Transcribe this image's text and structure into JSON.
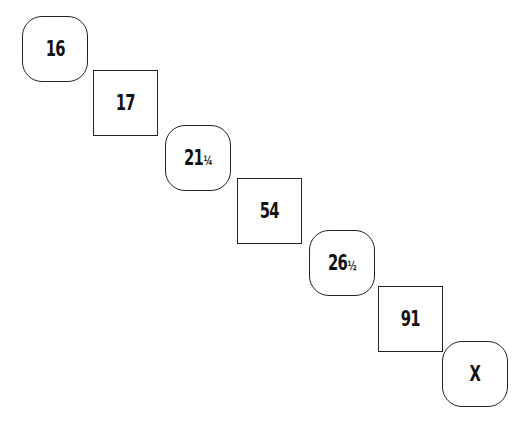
{
  "puzzle": {
    "description": "Number sequence puzzle with alternating rounded and square boxes arranged diagonally; find the missing value X",
    "items": [
      {
        "shape": "rounded",
        "whole": "16",
        "fraction": "",
        "x": 22,
        "y": 16
      },
      {
        "shape": "square",
        "whole": "17",
        "fraction": "",
        "x": 93,
        "y": 70
      },
      {
        "shape": "rounded",
        "whole": "21",
        "fraction": "¼",
        "x": 165,
        "y": 125
      },
      {
        "shape": "square",
        "whole": "54",
        "fraction": "",
        "x": 237,
        "y": 178
      },
      {
        "shape": "rounded",
        "whole": "26",
        "fraction": "½",
        "x": 309,
        "y": 230
      },
      {
        "shape": "square",
        "whole": "91",
        "fraction": "",
        "x": 378,
        "y": 286
      },
      {
        "shape": "rounded",
        "whole": "X",
        "fraction": "",
        "x": 442,
        "y": 341
      }
    ]
  }
}
